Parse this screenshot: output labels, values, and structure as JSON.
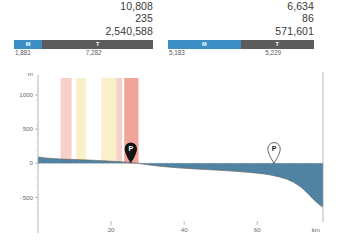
{
  "stats": {
    "left_panel": {
      "numbers": [
        "10,808",
        "235",
        "2,540,588"
      ],
      "bar": {
        "segments": [
          {
            "label": "M",
            "value": "1,881",
            "color": "#3b8fc4",
            "pct": 20.4
          },
          {
            "label": "T",
            "value": "7,282",
            "color": "#5c5c5c",
            "pct": 79.6
          }
        ]
      }
    },
    "right_panel": {
      "numbers": [
        "6,634",
        "86",
        "571,601"
      ],
      "bar": {
        "segments": [
          {
            "label": "M",
            "value": "5,183",
            "color": "#3b8fc4",
            "pct": 49.8
          },
          {
            "label": "T",
            "value": "5,229",
            "color": "#5c5c5c",
            "pct": 50.2
          }
        ]
      }
    }
  },
  "chart_data": {
    "type": "area",
    "title": "",
    "xlabel": "km",
    "ylabel": "m",
    "xlim": [
      0,
      78
    ],
    "ylim": [
      -700,
      1250
    ],
    "xticks": [
      20,
      40,
      60
    ],
    "xticklabels": [
      "20",
      "40",
      "60"
    ],
    "yticks": [
      1000,
      500,
      0,
      -500
    ],
    "yticklabels": [
      "1000",
      "500",
      "0",
      "-500"
    ],
    "grid": false,
    "zero_line": true,
    "area_color": "#41779a",
    "line_color": "#6a6a6a",
    "series": [
      {
        "name": "elevation",
        "x": [
          0,
          2,
          4,
          6,
          8,
          10,
          12,
          14,
          16,
          18,
          20,
          22,
          24,
          25.5,
          27,
          30,
          34,
          38,
          42,
          46,
          50,
          54,
          58,
          62,
          64,
          66,
          68,
          70,
          72,
          73,
          74,
          75,
          76,
          77,
          78
        ],
        "y": [
          92,
          78,
          70,
          64,
          58,
          54,
          50,
          46,
          42,
          36,
          30,
          24,
          16,
          8,
          2,
          -22,
          -48,
          -66,
          -80,
          -92,
          -104,
          -118,
          -134,
          -158,
          -176,
          -200,
          -232,
          -280,
          -352,
          -400,
          -452,
          -508,
          -560,
          -608,
          -640
        ]
      }
    ],
    "bands": [
      {
        "x0": 6.2,
        "x1": 9.2,
        "color": "#f6c8c0",
        "opacity": 0.85
      },
      {
        "x0": 10.4,
        "x1": 13.1,
        "color": "#f8ecc0",
        "opacity": 0.85
      },
      {
        "x0": 17.3,
        "x1": 21.4,
        "color": "#f8ecc0",
        "opacity": 0.85
      },
      {
        "x0": 21.4,
        "x1": 23.0,
        "color": "#f6c8c0",
        "opacity": 0.85
      },
      {
        "x0": 23.6,
        "x1": 27.5,
        "color": "#f09a90",
        "opacity": 0.9
      }
    ],
    "markers": [
      {
        "label": "P",
        "x": 25.4,
        "y": 0,
        "style": "filled",
        "fill": "#141414",
        "text_color": "#ffffff"
      },
      {
        "label": "P",
        "x": 64.6,
        "y": 0,
        "style": "outlined",
        "fill": "#ffffff",
        "text_color": "#222222"
      }
    ]
  }
}
